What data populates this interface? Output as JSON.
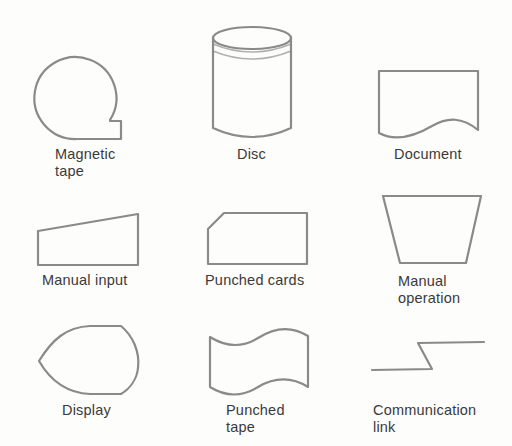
{
  "diagram": {
    "type": "flowchart-symbol-legend",
    "stroke_color": "#8a8a8a",
    "text_color": "#3a3a3a",
    "symbols": [
      {
        "id": "magnetic-tape",
        "line1": "Magnetic",
        "line2": "tape"
      },
      {
        "id": "disc",
        "line1": "Disc",
        "line2": ""
      },
      {
        "id": "document",
        "line1": "Document",
        "line2": ""
      },
      {
        "id": "manual-input",
        "line1": "Manual input",
        "line2": ""
      },
      {
        "id": "punched-cards",
        "line1": "Punched cards",
        "line2": ""
      },
      {
        "id": "manual-operation",
        "line1": "Manual",
        "line2": "operation"
      },
      {
        "id": "display",
        "line1": "Display",
        "line2": ""
      },
      {
        "id": "punched-tape",
        "line1": "Punched",
        "line2": "tape"
      },
      {
        "id": "communication-link",
        "line1": "Communication",
        "line2": "link"
      }
    ]
  }
}
